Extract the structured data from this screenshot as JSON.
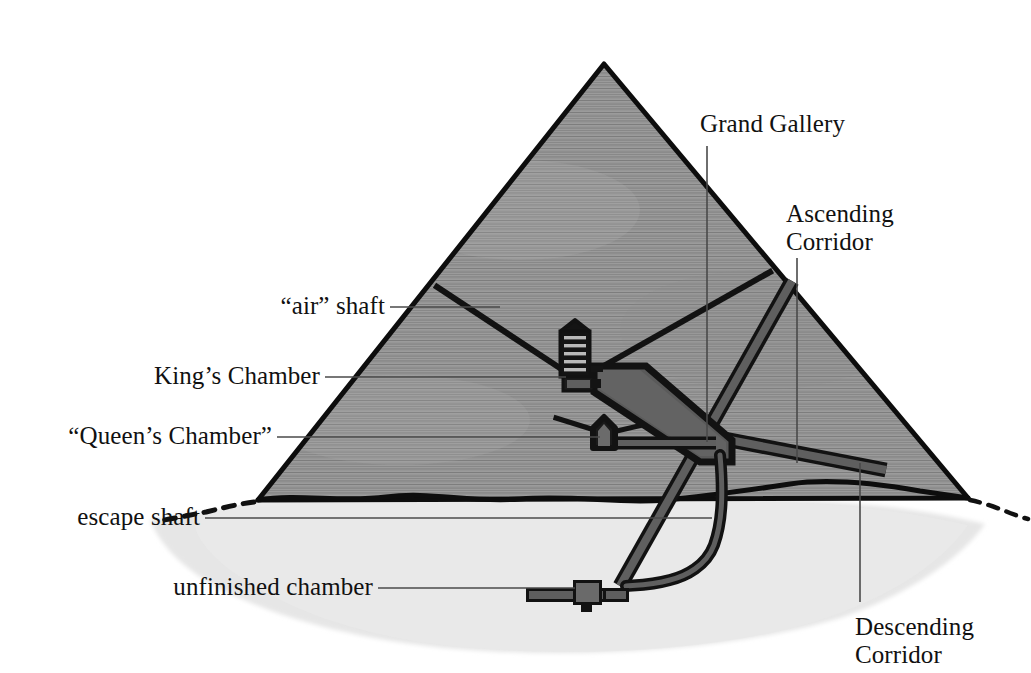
{
  "figure": {
    "width": 1031,
    "height": 673,
    "background_color": "#ffffff"
  },
  "colors": {
    "masonry_fill": "#9a9a9a",
    "masonry_course_line": "#6e6e6e",
    "outline": "#0d0d0d",
    "bedrock_fill": "#e3e3e3",
    "passage_fill": "#5d5d5d",
    "gallery_fill": "#565656",
    "leader_line": "#4a4a4a",
    "text": "#111111"
  },
  "labels": {
    "grand_gallery": "Grand Gallery",
    "ascending_corridor_line1": "Ascending",
    "ascending_corridor_line2": "Corridor",
    "air_shaft": "“air” shaft",
    "kings_chamber": "King’s Chamber",
    "queens_chamber": "“Queen’s Chamber”",
    "escape_shaft": "escape shaft",
    "unfinished_chamber": "unfinished chamber",
    "descending_corridor_line1": "Descending",
    "descending_corridor_line2": "Corridor"
  },
  "structures": [
    {
      "name": "pyramid-body",
      "description": "Large triangular masonry mass with horizontal coursing texture"
    },
    {
      "name": "bedrock",
      "description": "Light grey irregular plateau beneath the pyramid base"
    },
    {
      "name": "kings-chamber",
      "description": "Burial chamber with five stacked relieving chambers and gabled roof"
    },
    {
      "name": "queens-chamber",
      "description": "Smaller gabled chamber below and left of the Grand Gallery"
    },
    {
      "name": "grand-gallery",
      "description": "Steeply sloping corbelled gallery rising to the King's Chamber"
    },
    {
      "name": "ascending-corridor",
      "description": "Corridor rising from the descending corridor to the Grand Gallery"
    },
    {
      "name": "descending-corridor",
      "description": "Corridor descending from the north face entrance to the unfinished chamber"
    },
    {
      "name": "escape-shaft",
      "description": "Curving well shaft connecting the Grand Gallery to the descending corridor"
    },
    {
      "name": "unfinished-chamber",
      "description": "Subterranean unfinished chamber cut into bedrock"
    },
    {
      "name": "air-shafts",
      "description": "Narrow shafts rising diagonally from the King's and Queen's chambers"
    }
  ]
}
